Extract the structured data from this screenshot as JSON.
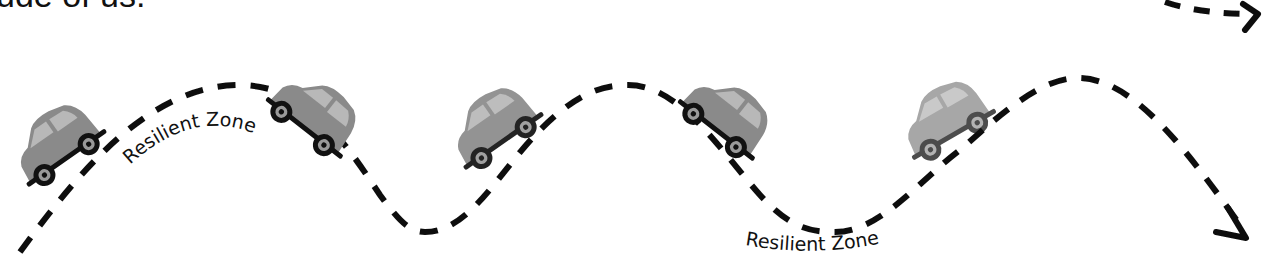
{
  "heading_fragment": "ude of us.",
  "labels": {
    "zone_1": "Resilient Zone",
    "zone_2": "Resilient Zone"
  },
  "colors": {
    "path": "#111111",
    "car_body": "#8a8a8a",
    "car_window": "#b5b5b5",
    "wheel": "#111111",
    "hub": "#9a9a9a"
  },
  "cars": [
    {
      "id": "car-1",
      "x": 60,
      "y": 150,
      "angle": -35,
      "shade": "#8c8c8c"
    },
    {
      "id": "car-2",
      "x": 305,
      "y": 115,
      "angle": 38,
      "shade": "#8a8a8a"
    },
    {
      "id": "car-3",
      "x": 495,
      "y": 130,
      "angle": -35,
      "shade": "#9a9a9a"
    },
    {
      "id": "car-4",
      "x": 718,
      "y": 118,
      "angle": 38,
      "shade": "#8f8f8f"
    },
    {
      "id": "car-5",
      "x": 945,
      "y": 125,
      "angle": -30,
      "shade": "#a8a8a8"
    }
  ]
}
